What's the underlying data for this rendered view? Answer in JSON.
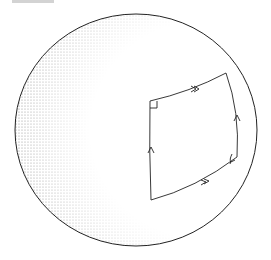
{
  "diagram": {
    "type": "sphere-geodesic-quadrilateral",
    "caption_fragment": "",
    "colors": {
      "stroke": "#222222",
      "stipple": "#555555",
      "background": "#ffffff"
    },
    "sphere": {
      "cx": 136,
      "cy": 130,
      "rx": 121,
      "ry": 116
    },
    "quadrilateral": {
      "corners": {
        "top_left": [
          150,
          101
        ],
        "top_right": [
          226,
          73
        ],
        "bottom_right": [
          237,
          157
        ],
        "bottom_left": [
          151,
          200
        ]
      },
      "right_angle_markers": [
        "top_left",
        "bottom_right"
      ],
      "arrows": [
        {
          "edge": "top",
          "style": "double-chevron",
          "direction": "right"
        },
        {
          "edge": "bottom",
          "style": "double-chevron",
          "direction": "right"
        },
        {
          "edge": "left",
          "style": "single-chevron",
          "direction": "up"
        },
        {
          "edge": "right",
          "style": "single-chevron",
          "direction": "up"
        }
      ]
    }
  }
}
